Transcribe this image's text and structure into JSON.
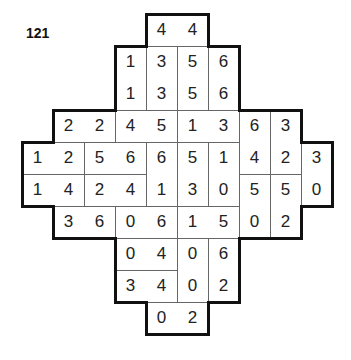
{
  "puzzle": {
    "number": "121",
    "origin": {
      "x": 22,
      "y": 14
    },
    "cell_w": 31,
    "cell_h": 32,
    "rows": [
      {
        "row": 0,
        "cells": [
          {
            "c": 4,
            "v": "4"
          },
          {
            "c": 5,
            "v": "4"
          }
        ]
      },
      {
        "row": 1,
        "cells": [
          {
            "c": 3,
            "v": "1"
          },
          {
            "c": 4,
            "v": "3"
          },
          {
            "c": 5,
            "v": "5"
          },
          {
            "c": 6,
            "v": "6"
          }
        ]
      },
      {
        "row": 2,
        "cells": [
          {
            "c": 3,
            "v": "1"
          },
          {
            "c": 4,
            "v": "3"
          },
          {
            "c": 5,
            "v": "5"
          },
          {
            "c": 6,
            "v": "6"
          }
        ]
      },
      {
        "row": 3,
        "cells": [
          {
            "c": 1,
            "v": "2"
          },
          {
            "c": 2,
            "v": "2"
          },
          {
            "c": 3,
            "v": "4"
          },
          {
            "c": 4,
            "v": "5"
          },
          {
            "c": 5,
            "v": "1"
          },
          {
            "c": 6,
            "v": "3"
          },
          {
            "c": 7,
            "v": "6"
          },
          {
            "c": 8,
            "v": "3"
          }
        ]
      },
      {
        "row": 4,
        "cells": [
          {
            "c": 0,
            "v": "1"
          },
          {
            "c": 1,
            "v": "2"
          },
          {
            "c": 2,
            "v": "5"
          },
          {
            "c": 3,
            "v": "6"
          },
          {
            "c": 4,
            "v": "6"
          },
          {
            "c": 5,
            "v": "5"
          },
          {
            "c": 6,
            "v": "1"
          },
          {
            "c": 7,
            "v": "4"
          },
          {
            "c": 8,
            "v": "2"
          },
          {
            "c": 9,
            "v": "3"
          }
        ]
      },
      {
        "row": 5,
        "cells": [
          {
            "c": 0,
            "v": "1"
          },
          {
            "c": 1,
            "v": "4"
          },
          {
            "c": 2,
            "v": "2"
          },
          {
            "c": 3,
            "v": "4"
          },
          {
            "c": 4,
            "v": "1"
          },
          {
            "c": 5,
            "v": "3"
          },
          {
            "c": 6,
            "v": "0"
          },
          {
            "c": 7,
            "v": "5"
          },
          {
            "c": 8,
            "v": "5"
          },
          {
            "c": 9,
            "v": "0"
          }
        ]
      },
      {
        "row": 6,
        "cells": [
          {
            "c": 1,
            "v": "3"
          },
          {
            "c": 2,
            "v": "6"
          },
          {
            "c": 3,
            "v": "0"
          },
          {
            "c": 4,
            "v": "6"
          },
          {
            "c": 5,
            "v": "1"
          },
          {
            "c": 6,
            "v": "5"
          },
          {
            "c": 7,
            "v": "0"
          },
          {
            "c": 8,
            "v": "2"
          }
        ]
      },
      {
        "row": 7,
        "cells": [
          {
            "c": 3,
            "v": "0"
          },
          {
            "c": 4,
            "v": "4"
          },
          {
            "c": 5,
            "v": "0"
          },
          {
            "c": 6,
            "v": "6"
          }
        ]
      },
      {
        "row": 8,
        "cells": [
          {
            "c": 3,
            "v": "3"
          },
          {
            "c": 4,
            "v": "4"
          },
          {
            "c": 5,
            "v": "0"
          },
          {
            "c": 6,
            "v": "2"
          }
        ]
      },
      {
        "row": 9,
        "cells": [
          {
            "c": 4,
            "v": "0"
          },
          {
            "c": 5,
            "v": "2"
          }
        ]
      }
    ],
    "dominoes": [
      [
        0,
        4,
        0,
        5
      ],
      [
        1,
        3,
        2,
        3
      ],
      [
        1,
        4,
        2,
        4
      ],
      [
        1,
        5,
        2,
        5
      ],
      [
        1,
        6,
        2,
        6
      ],
      [
        3,
        1,
        3,
        2
      ],
      [
        3,
        3,
        3,
        4
      ],
      [
        3,
        5,
        3,
        6
      ],
      [
        3,
        7,
        4,
        7
      ],
      [
        3,
        8,
        4,
        8
      ],
      [
        4,
        0,
        4,
        1
      ],
      [
        4,
        2,
        4,
        3
      ],
      [
        4,
        4,
        5,
        4
      ],
      [
        4,
        5,
        5,
        5
      ],
      [
        4,
        6,
        5,
        6
      ],
      [
        4,
        9,
        5,
        9
      ],
      [
        5,
        0,
        5,
        1
      ],
      [
        5,
        2,
        5,
        3
      ],
      [
        5,
        7,
        6,
        7
      ],
      [
        5,
        8,
        6,
        8
      ],
      [
        6,
        1,
        6,
        2
      ],
      [
        6,
        3,
        6,
        4
      ],
      [
        6,
        5,
        6,
        6
      ],
      [
        7,
        3,
        7,
        4
      ],
      [
        7,
        5,
        8,
        5
      ],
      [
        7,
        6,
        8,
        6
      ],
      [
        8,
        3,
        8,
        4
      ],
      [
        9,
        4,
        9,
        5
      ]
    ],
    "outline_color": "#111111",
    "line_color": "#666666"
  }
}
